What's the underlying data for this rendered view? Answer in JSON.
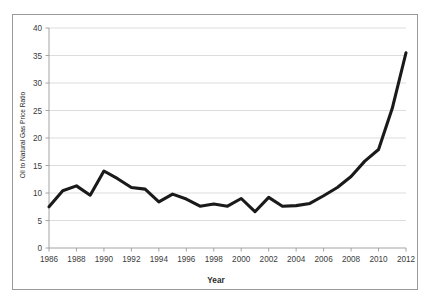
{
  "chart_data": {
    "type": "line",
    "title": "",
    "xlabel": "Year",
    "ylabel": "Oil to Natural Gas Price Ratio",
    "xlim": [
      1986,
      2012
    ],
    "ylim": [
      0,
      40
    ],
    "grid": true,
    "legend": "none",
    "x_tick_labels": [
      "1986",
      "1988",
      "1990",
      "1992",
      "1994",
      "1996",
      "1998",
      "2000",
      "2002",
      "2004",
      "2006",
      "2008",
      "2010",
      "2012"
    ],
    "y_tick_labels": [
      "0",
      "5",
      "10",
      "15",
      "20",
      "25",
      "30",
      "35",
      "40"
    ],
    "x": [
      1986,
      1987,
      1988,
      1989,
      1990,
      1991,
      1992,
      1993,
      1994,
      1995,
      1996,
      1997,
      1998,
      1999,
      2000,
      2001,
      2002,
      2003,
      2004,
      2005,
      2006,
      2007,
      2008,
      2009,
      2010,
      2011,
      2012
    ],
    "series": [
      {
        "name": "Oil to Natural Gas Price Ratio",
        "color": "#1a1a1a",
        "values": [
          7.5,
          10.4,
          11.3,
          9.6,
          14.0,
          12.6,
          11.0,
          10.7,
          8.4,
          9.8,
          8.9,
          7.6,
          8.0,
          7.6,
          9.0,
          6.6,
          9.2,
          7.6,
          7.7,
          8.1,
          9.5,
          11.0,
          13.0,
          15.8,
          17.9,
          25.4,
          35.5
        ]
      }
    ]
  },
  "axis": {
    "x_title": "Year",
    "y_title": "Oil to Natural Gas Price Ratio"
  }
}
